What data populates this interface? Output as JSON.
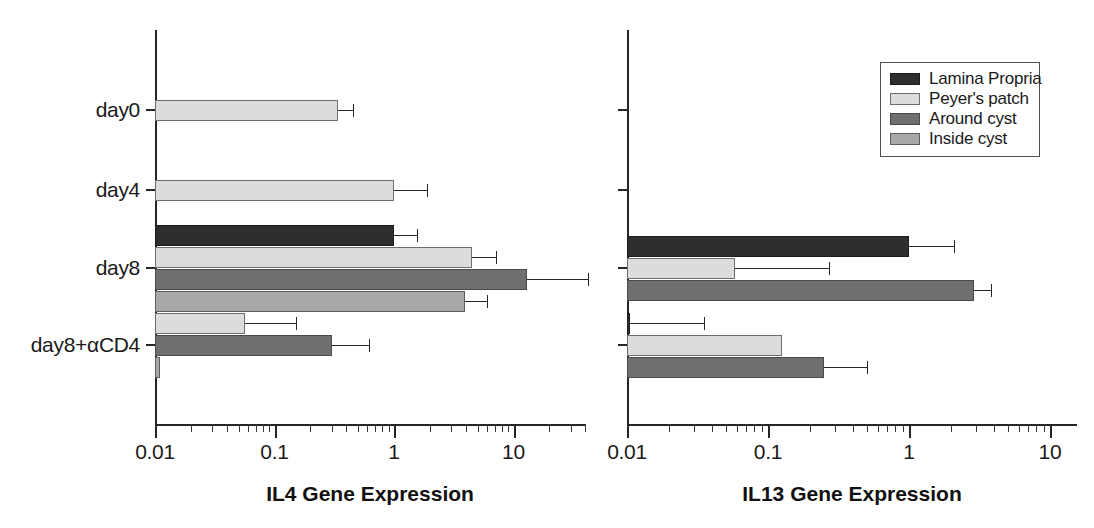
{
  "figure": {
    "title": "",
    "background": "#ffffff",
    "series_colors": [
      "#2e2e2e",
      "#dcdcdc",
      "#6f6f6f",
      "#a8a8a8"
    ]
  },
  "legend": {
    "position": "top-right",
    "items": [
      {
        "label": "Lamina Propria",
        "color": "#2e2e2e"
      },
      {
        "label": "Peyer's patch",
        "color": "#dcdcdc"
      },
      {
        "label": "Around cyst",
        "color": "#6f6f6f"
      },
      {
        "label": "Inside cyst",
        "color": "#a8a8a8"
      }
    ]
  },
  "chart_data": [
    {
      "type": "bar",
      "orientation": "horizontal",
      "id": "il4",
      "title": "",
      "xlabel": "IL4 Gene Expression",
      "ylabel": "",
      "xscale": "log",
      "xlim": [
        0.01,
        50
      ],
      "xticks": [
        0.01,
        0.1,
        1,
        10
      ],
      "xticklabels": [
        "0.01",
        "0.1",
        "1",
        "10"
      ],
      "grid": false,
      "categories": [
        "day0",
        "day4",
        "day8",
        "day8+αCD4"
      ],
      "series": [
        {
          "name": "Lamina Propria",
          "color": "#2e2e2e",
          "values": [
            null,
            null,
            1.0,
            null
          ],
          "errors_high": [
            null,
            null,
            1.55,
            null
          ]
        },
        {
          "name": "Peyer's patch",
          "color": "#dcdcdc",
          "values": [
            0.34,
            1.0,
            4.5,
            0.057
          ],
          "errors_high": [
            0.45,
            1.9,
            7.2,
            0.15
          ]
        },
        {
          "name": "Around cyst",
          "color": "#6f6f6f",
          "values": [
            null,
            null,
            13.0,
            0.3
          ],
          "errors_high": [
            null,
            null,
            42.0,
            0.62
          ]
        },
        {
          "name": "Inside cyst",
          "color": "#a8a8a8",
          "values": [
            null,
            null,
            3.9,
            0.011
          ],
          "errors_high": [
            null,
            null,
            6.0,
            null
          ]
        }
      ]
    },
    {
      "type": "bar",
      "orientation": "horizontal",
      "id": "il13",
      "title": "",
      "xlabel": "IL13 Gene Expression",
      "ylabel": "",
      "xscale": "log",
      "xlim": [
        0.01,
        10
      ],
      "xticks": [
        0.01,
        0.1,
        1,
        10
      ],
      "xticklabels": [
        "0.01",
        "0.1",
        "1",
        "10"
      ],
      "grid": false,
      "categories": [
        "day0",
        "day4",
        "day8",
        "day8+αCD4"
      ],
      "series": [
        {
          "name": "Lamina Propria",
          "color": "#2e2e2e",
          "values": [
            null,
            null,
            1.0,
            0.0105
          ],
          "errors_high": [
            null,
            null,
            2.1,
            0.035
          ]
        },
        {
          "name": "Peyer's patch",
          "color": "#dcdcdc",
          "values": [
            null,
            null,
            0.058,
            0.125
          ],
          "errors_high": [
            null,
            null,
            0.27,
            null
          ]
        },
        {
          "name": "Around cyst",
          "color": "#6f6f6f",
          "values": [
            null,
            null,
            2.9,
            0.25
          ],
          "errors_high": [
            null,
            null,
            3.8,
            0.5
          ]
        },
        {
          "name": "Inside cyst",
          "color": "#a8a8a8",
          "values": [
            null,
            null,
            null,
            null
          ],
          "errors_high": [
            null,
            null,
            null,
            null
          ]
        }
      ]
    }
  ]
}
